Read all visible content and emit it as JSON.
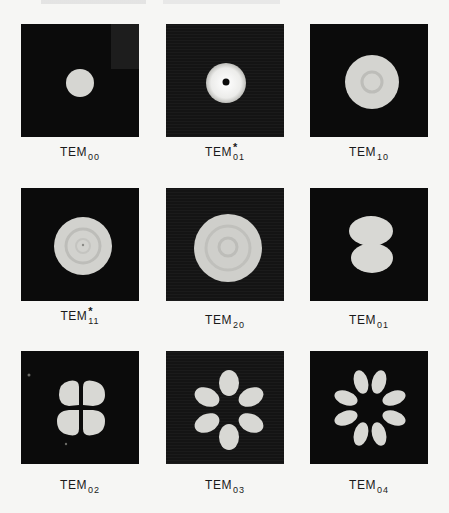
{
  "page": {
    "header_text_visible": false
  },
  "colors": {
    "page_background": "#f6f6f4",
    "panel_background": "#0b0b0b",
    "beam_spot": "#d8d8d4",
    "text": "#1a1a1a"
  },
  "figures": [
    {
      "mode": "TEM",
      "subscript": "00",
      "starred": false,
      "pattern": "single-spot"
    },
    {
      "mode": "TEM",
      "subscript": "01",
      "starred": true,
      "star_glyph": "*",
      "pattern": "ring-with-dark-center"
    },
    {
      "mode": "TEM",
      "subscript": "10",
      "starred": false,
      "pattern": "disk-with-inner-ring"
    },
    {
      "mode": "TEM",
      "subscript": "11",
      "starred": true,
      "star_glyph": "*",
      "pattern": "disk-with-two-rings"
    },
    {
      "mode": "TEM",
      "subscript": "20",
      "starred": false,
      "pattern": "large-disk-with-rings"
    },
    {
      "mode": "TEM",
      "subscript": "01",
      "starred": false,
      "pattern": "two-lobes-vertical"
    },
    {
      "mode": "TEM",
      "subscript": "02",
      "starred": false,
      "pattern": "four-lobes"
    },
    {
      "mode": "TEM",
      "subscript": "03",
      "starred": false,
      "pattern": "six-lobes"
    },
    {
      "mode": "TEM",
      "subscript": "04",
      "starred": false,
      "pattern": "eight-lobes"
    }
  ]
}
